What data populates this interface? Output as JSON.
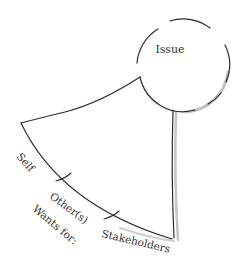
{
  "diagram": {
    "issue_label": "Issue",
    "wants_for_label": "Wants for:",
    "segments": [
      {
        "label": "Self"
      },
      {
        "label": "Other(s)"
      },
      {
        "label": "Stakeholders"
      }
    ],
    "colors": {
      "stroke": "#2b2b2b",
      "shadow": "#b8b8b8",
      "text": "#333333",
      "background": "#ffffff"
    }
  }
}
